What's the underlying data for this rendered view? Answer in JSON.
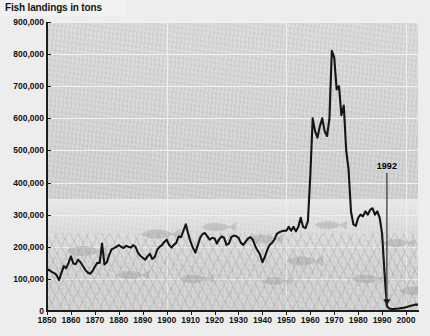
{
  "chart": {
    "title": "Fish landings in tons",
    "type": "line"
  },
  "annotations": [
    {
      "name": "collapse-year",
      "label": "1992",
      "x": 1992,
      "y": 0
    }
  ],
  "axes": {
    "y": {
      "label": "Fish landings in tons",
      "min": 0,
      "max": 900000,
      "step": 100000,
      "ticks": [
        "0",
        "100,000",
        "200,000",
        "300,000",
        "400,000",
        "500,000",
        "600,000",
        "700,000",
        "800,000",
        "900,000"
      ]
    },
    "x": {
      "min": 1850,
      "max": 2005,
      "step": 10,
      "ticks": [
        "1850",
        "1860",
        "1870",
        "1880",
        "1890",
        "1900",
        "1910",
        "1920",
        "1930",
        "1940",
        "1950",
        "1960",
        "1970",
        "1980",
        "1990",
        "2000"
      ]
    }
  },
  "colors": {
    "plot_background": "#d6d6d6",
    "grid": "#f2f2f2",
    "series_line": "#151515",
    "axis": "#1d1d1d",
    "title_band": "#f2f2f2",
    "page_background": "#ededed"
  },
  "chart_data": {
    "type": "line",
    "title": "Fish landings in tons",
    "xlabel": "",
    "ylabel": "Fish landings in tons",
    "xlim": [
      1850,
      2005
    ],
    "ylim": [
      0,
      900000
    ],
    "grid": true,
    "legend": null,
    "annotations": [
      {
        "text": "1992",
        "x": 1992,
        "y": 0,
        "note": "arrow pointing to the collapse of the fishery"
      }
    ],
    "series": [
      {
        "name": "Fish landings",
        "units": "tons",
        "x": [
          1850,
          1851,
          1852,
          1853,
          1854,
          1855,
          1856,
          1857,
          1858,
          1859,
          1860,
          1861,
          1862,
          1863,
          1864,
          1865,
          1866,
          1867,
          1868,
          1869,
          1870,
          1871,
          1872,
          1873,
          1874,
          1875,
          1876,
          1877,
          1878,
          1879,
          1880,
          1881,
          1882,
          1883,
          1884,
          1885,
          1886,
          1887,
          1888,
          1889,
          1890,
          1891,
          1892,
          1893,
          1894,
          1895,
          1896,
          1897,
          1898,
          1899,
          1900,
          1901,
          1902,
          1903,
          1904,
          1905,
          1906,
          1907,
          1908,
          1909,
          1910,
          1911,
          1912,
          1913,
          1914,
          1915,
          1916,
          1917,
          1918,
          1919,
          1920,
          1921,
          1922,
          1923,
          1924,
          1925,
          1926,
          1927,
          1928,
          1929,
          1930,
          1931,
          1932,
          1933,
          1934,
          1935,
          1936,
          1937,
          1938,
          1939,
          1940,
          1941,
          1942,
          1943,
          1944,
          1945,
          1946,
          1947,
          1948,
          1949,
          1950,
          1951,
          1952,
          1953,
          1954,
          1955,
          1956,
          1957,
          1958,
          1959,
          1960,
          1961,
          1962,
          1963,
          1964,
          1965,
          1966,
          1967,
          1968,
          1969,
          1970,
          1971,
          1972,
          1973,
          1974,
          1975,
          1976,
          1977,
          1978,
          1979,
          1980,
          1981,
          1982,
          1983,
          1984,
          1985,
          1986,
          1987,
          1988,
          1989,
          1990,
          1991,
          1992,
          1993,
          1994,
          1995,
          1996,
          1997,
          1998,
          1999,
          2000,
          2001,
          2002,
          2003,
          2004,
          2005
        ],
        "values": [
          130000,
          127000,
          122000,
          118000,
          112000,
          96000,
          118000,
          140000,
          133000,
          150000,
          170000,
          148000,
          146000,
          160000,
          152000,
          140000,
          128000,
          120000,
          116000,
          124000,
          138000,
          150000,
          150000,
          210000,
          145000,
          152000,
          175000,
          192000,
          196000,
          200000,
          205000,
          200000,
          196000,
          203000,
          200000,
          198000,
          205000,
          200000,
          182000,
          172000,
          166000,
          160000,
          170000,
          178000,
          162000,
          168000,
          190000,
          200000,
          205000,
          215000,
          222000,
          206000,
          198000,
          206000,
          212000,
          232000,
          230000,
          250000,
          270000,
          240000,
          215000,
          196000,
          182000,
          205000,
          228000,
          240000,
          243000,
          232000,
          222000,
          228000,
          226000,
          210000,
          224000,
          232000,
          228000,
          206000,
          210000,
          230000,
          235000,
          233000,
          228000,
          212000,
          206000,
          216000,
          226000,
          230000,
          222000,
          202000,
          188000,
          176000,
          152000,
          168000,
          190000,
          206000,
          212000,
          222000,
          240000,
          245000,
          248000,
          250000,
          250000,
          262000,
          250000,
          262000,
          248000,
          262000,
          290000,
          262000,
          258000,
          280000,
          420000,
          600000,
          560000,
          540000,
          575000,
          600000,
          560000,
          545000,
          600000,
          810000,
          790000,
          690000,
          700000,
          610000,
          640000,
          500000,
          440000,
          310000,
          270000,
          265000,
          290000,
          300000,
          295000,
          310000,
          300000,
          315000,
          320000,
          300000,
          310000,
          290000,
          240000,
          120000,
          15000,
          8000,
          6000,
          6000,
          7000,
          8000,
          9000,
          10000,
          12000,
          14000,
          16000,
          18000,
          20000,
          20000
        ],
        "notes": "Canadian Atlantic cod landings; collapse and 1992 moratorium"
      }
    ]
  },
  "watermarks": {
    "name": "fish-silhouettes",
    "count": 12,
    "description": "faint grey fish illustrations over a sea-floor texture"
  }
}
